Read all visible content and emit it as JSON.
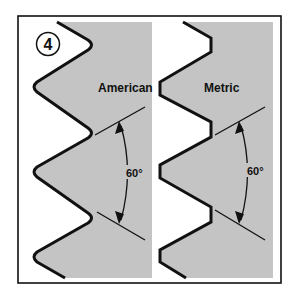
{
  "figure": {
    "number": "4",
    "colors": {
      "background": "#ffffff",
      "fill": "#c4c4c4",
      "ink": "#111111"
    },
    "panels": [
      {
        "id": "american",
        "label": "American",
        "profile": "rounded",
        "angle_label": "60°"
      },
      {
        "id": "metric",
        "label": "Metric",
        "profile": "flat",
        "angle_label": "60°"
      }
    ]
  }
}
